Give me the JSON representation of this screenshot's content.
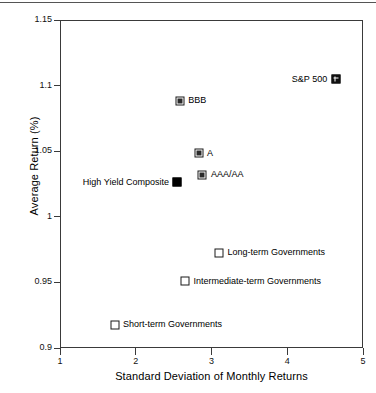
{
  "chart_data": {
    "type": "scatter",
    "title": "",
    "xlabel": "Standard Deviation of Monthly Returns",
    "ylabel": "Average Return (%)",
    "xlim": [
      1,
      5
    ],
    "ylim": [
      0.9,
      1.15
    ],
    "xticks": [
      "1",
      "2",
      "3",
      "4",
      "5"
    ],
    "xtick_values": [
      1,
      2,
      3,
      4,
      5
    ],
    "yticks": [
      "1.15",
      "1.1",
      "1.05",
      "1",
      "0.95",
      "0.9"
    ],
    "ytick_values": [
      1.15,
      1.1,
      1.05,
      1.0,
      0.95,
      0.9
    ],
    "grid": false,
    "legend": "none",
    "points": [
      {
        "label": "S&P 500",
        "x": 4.64,
        "y": 1.105,
        "marker": "gridsq",
        "label_side": "left"
      },
      {
        "label": "BBB",
        "x": 2.58,
        "y": 1.0885,
        "marker": "half",
        "label_side": "right"
      },
      {
        "label": "A",
        "x": 2.83,
        "y": 1.0485,
        "marker": "half",
        "label_side": "right"
      },
      {
        "label": "AAA/AA",
        "x": 2.88,
        "y": 1.032,
        "marker": "half",
        "label_side": "right"
      },
      {
        "label": "High Yield Composite",
        "x": 2.55,
        "y": 1.0265,
        "marker": "filled",
        "label_side": "left"
      },
      {
        "label": "Long-term Governments",
        "x": 3.1,
        "y": 0.9725,
        "marker": "open",
        "label_side": "right"
      },
      {
        "label": "Intermediate-term Governments",
        "x": 2.65,
        "y": 0.9507,
        "marker": "open",
        "label_side": "right"
      },
      {
        "label": "Short-term Governments",
        "x": 1.72,
        "y": 0.9178,
        "marker": "open",
        "label_side": "right"
      }
    ]
  }
}
